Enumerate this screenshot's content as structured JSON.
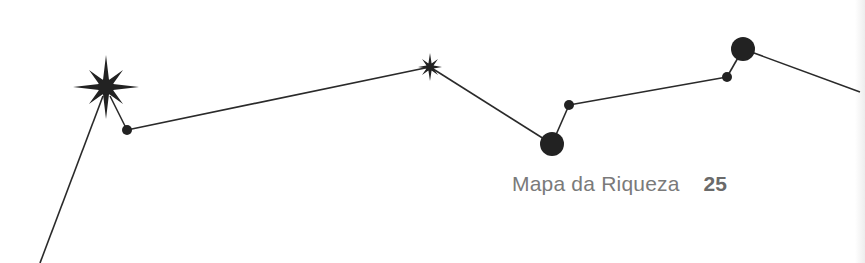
{
  "footer": {
    "running_title": "Mapa da Riqueza",
    "page_number": "25"
  },
  "colors": {
    "ink": "#222222",
    "footer_text": "#7a7a7a",
    "page_number": "#6a6a6a",
    "background": "#ffffff"
  },
  "constellation": {
    "nodes": [
      {
        "type": "star-large",
        "x": 106,
        "y": 87
      },
      {
        "type": "dot-small",
        "x": 127,
        "y": 130
      },
      {
        "type": "star-small",
        "x": 430,
        "y": 67
      },
      {
        "type": "circle-large",
        "x": 552,
        "y": 144
      },
      {
        "type": "dot-small",
        "x": 569,
        "y": 105
      },
      {
        "type": "dot-small",
        "x": 727,
        "y": 77
      },
      {
        "type": "circle-large",
        "x": 743,
        "y": 49
      }
    ]
  }
}
